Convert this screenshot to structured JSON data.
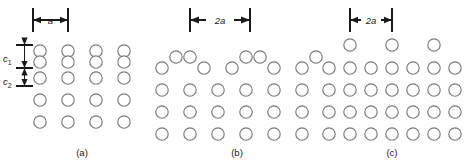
{
  "figure": {
    "background_color": "#ffffff",
    "atom_stroke_color": "#7a7a7f",
    "annotation_color": "#1a1a1a",
    "width": 470,
    "height": 165
  },
  "dimension_labels": {
    "panel_a": "a",
    "panel_b": "2a",
    "panel_c": "2a"
  },
  "spacing_labels": [
    {
      "base": "c",
      "sub": "1",
      "text": "c1"
    },
    {
      "base": "c",
      "sub": "2",
      "text": "c2"
    }
  ],
  "captions": {
    "a": "(a)",
    "b": "(b)",
    "c": "(c)"
  },
  "chart_data": {
    "type": "scatter",
    "xlabel": "",
    "ylabel": "",
    "panels": [
      {
        "id": "a",
        "caption": "(a)",
        "dimension_label": "a",
        "dimension_span_px": [
          33,
          68
        ],
        "columns": 4,
        "rows": 5,
        "description": "Top row atoms paired vertically (dimer pairs) above a regular lattice",
        "atoms": [
          {
            "cx": 40,
            "cy": 51,
            "r": 6.2
          },
          {
            "cx": 40,
            "cy": 62,
            "r": 6.2
          },
          {
            "cx": 40,
            "cy": 78,
            "r": 6.2
          },
          {
            "cx": 40,
            "cy": 100,
            "r": 6.2
          },
          {
            "cx": 40,
            "cy": 122,
            "r": 6.2
          },
          {
            "cx": 68,
            "cy": 51,
            "r": 6.2
          },
          {
            "cx": 68,
            "cy": 62,
            "r": 6.2
          },
          {
            "cx": 68,
            "cy": 78,
            "r": 6.2
          },
          {
            "cx": 68,
            "cy": 100,
            "r": 6.2
          },
          {
            "cx": 68,
            "cy": 122,
            "r": 6.2
          },
          {
            "cx": 96,
            "cy": 51,
            "r": 6.2
          },
          {
            "cx": 96,
            "cy": 62,
            "r": 6.2
          },
          {
            "cx": 96,
            "cy": 78,
            "r": 6.2
          },
          {
            "cx": 96,
            "cy": 100,
            "r": 6.2
          },
          {
            "cx": 96,
            "cy": 122,
            "r": 6.2
          },
          {
            "cx": 124,
            "cy": 51,
            "r": 6.2
          },
          {
            "cx": 124,
            "cy": 62,
            "r": 6.2
          },
          {
            "cx": 124,
            "cy": 78,
            "r": 6.2
          },
          {
            "cx": 124,
            "cy": 100,
            "r": 6.2
          },
          {
            "cx": 124,
            "cy": 122,
            "r": 6.2
          }
        ]
      },
      {
        "id": "b",
        "caption": "(b)",
        "dimension_label": "2a",
        "dimension_span_px": [
          190,
          250
        ],
        "columns": 6,
        "rows": 4,
        "description": "Paired raised adatoms forming 2a periodicity above lattice",
        "atoms": [
          {
            "cx": 162,
            "cy": 68,
            "r": 6.2
          },
          {
            "cx": 176,
            "cy": 57,
            "r": 6.2
          },
          {
            "cx": 190,
            "cy": 57,
            "r": 6.2
          },
          {
            "cx": 204,
            "cy": 68,
            "r": 6.2
          },
          {
            "cx": 232,
            "cy": 68,
            "r": 6.2
          },
          {
            "cx": 246,
            "cy": 57,
            "r": 6.2
          },
          {
            "cx": 260,
            "cy": 57,
            "r": 6.2
          },
          {
            "cx": 274,
            "cy": 68,
            "r": 6.2
          },
          {
            "cx": 302,
            "cy": 68,
            "r": 6.2
          },
          {
            "cx": 316,
            "cy": 57,
            "r": 6.2
          },
          {
            "cx": 162,
            "cy": 90,
            "r": 6.2
          },
          {
            "cx": 190,
            "cy": 90,
            "r": 6.2
          },
          {
            "cx": 218,
            "cy": 90,
            "r": 6.2
          },
          {
            "cx": 246,
            "cy": 90,
            "r": 6.2
          },
          {
            "cx": 274,
            "cy": 90,
            "r": 6.2
          },
          {
            "cx": 302,
            "cy": 90,
            "r": 6.2
          },
          {
            "cx": 162,
            "cy": 112,
            "r": 6.2
          },
          {
            "cx": 190,
            "cy": 112,
            "r": 6.2
          },
          {
            "cx": 218,
            "cy": 112,
            "r": 6.2
          },
          {
            "cx": 246,
            "cy": 112,
            "r": 6.2
          },
          {
            "cx": 274,
            "cy": 112,
            "r": 6.2
          },
          {
            "cx": 302,
            "cy": 112,
            "r": 6.2
          },
          {
            "cx": 162,
            "cy": 134,
            "r": 6.2
          },
          {
            "cx": 190,
            "cy": 134,
            "r": 6.2
          },
          {
            "cx": 218,
            "cy": 134,
            "r": 6.2
          },
          {
            "cx": 246,
            "cy": 134,
            "r": 6.2
          },
          {
            "cx": 274,
            "cy": 134,
            "r": 6.2
          },
          {
            "cx": 302,
            "cy": 134,
            "r": 6.2
          }
        ]
      },
      {
        "id": "c",
        "caption": "(c)",
        "dimension_label": "2a",
        "dimension_span_px": [
          350,
          390
        ],
        "columns": 6,
        "rows": 5,
        "description": "Single raised adatoms at every other site with 2a periodicity",
        "atoms": [
          {
            "cx": 350,
            "cy": 45,
            "r": 6.2
          },
          {
            "cx": 392,
            "cy": 45,
            "r": 6.2
          },
          {
            "cx": 434,
            "cy": 45,
            "r": 6.2
          },
          {
            "cx": 329,
            "cy": 68,
            "r": 6.2
          },
          {
            "cx": 350,
            "cy": 68,
            "r": 6.2
          },
          {
            "cx": 371,
            "cy": 68,
            "r": 6.2
          },
          {
            "cx": 392,
            "cy": 68,
            "r": 6.2
          },
          {
            "cx": 413,
            "cy": 68,
            "r": 6.2
          },
          {
            "cx": 434,
            "cy": 68,
            "r": 6.2
          },
          {
            "cx": 455,
            "cy": 68,
            "r": 6.2
          },
          {
            "cx": 329,
            "cy": 90,
            "r": 6.2
          },
          {
            "cx": 350,
            "cy": 90,
            "r": 6.2
          },
          {
            "cx": 371,
            "cy": 90,
            "r": 6.2
          },
          {
            "cx": 392,
            "cy": 90,
            "r": 6.2
          },
          {
            "cx": 413,
            "cy": 90,
            "r": 6.2
          },
          {
            "cx": 434,
            "cy": 90,
            "r": 6.2
          },
          {
            "cx": 455,
            "cy": 90,
            "r": 6.2
          },
          {
            "cx": 329,
            "cy": 112,
            "r": 6.2
          },
          {
            "cx": 350,
            "cy": 112,
            "r": 6.2
          },
          {
            "cx": 371,
            "cy": 112,
            "r": 6.2
          },
          {
            "cx": 392,
            "cy": 112,
            "r": 6.2
          },
          {
            "cx": 413,
            "cy": 112,
            "r": 6.2
          },
          {
            "cx": 434,
            "cy": 112,
            "r": 6.2
          },
          {
            "cx": 455,
            "cy": 112,
            "r": 6.2
          },
          {
            "cx": 329,
            "cy": 134,
            "r": 6.2
          },
          {
            "cx": 350,
            "cy": 134,
            "r": 6.2
          },
          {
            "cx": 371,
            "cy": 134,
            "r": 6.2
          },
          {
            "cx": 392,
            "cy": 134,
            "r": 6.2
          },
          {
            "cx": 413,
            "cy": 134,
            "r": 6.2
          },
          {
            "cx": 434,
            "cy": 134,
            "r": 6.2
          },
          {
            "cx": 455,
            "cy": 134,
            "r": 6.2
          }
        ]
      }
    ]
  }
}
